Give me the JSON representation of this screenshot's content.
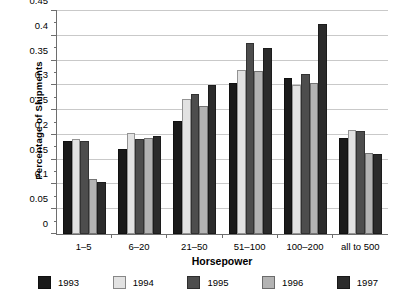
{
  "chart_data": {
    "type": "bar",
    "title": "",
    "xlabel": "Horsepower",
    "ylabel": "Percentage of Shipments",
    "categories": [
      "1–5",
      "6–20",
      "21–50",
      "51–100",
      "100–200",
      "all to 500"
    ],
    "series": [
      {
        "name": "1993",
        "color": "#1a1a1a",
        "values": [
          0.188,
          0.172,
          0.228,
          0.305,
          0.315,
          0.193
        ]
      },
      {
        "name": "1994",
        "color": "#e2e2e2",
        "values": [
          0.191,
          0.204,
          0.272,
          0.33,
          0.3,
          0.21
        ]
      },
      {
        "name": "1995",
        "color": "#4d4d4d",
        "values": [
          0.188,
          0.192,
          0.283,
          0.385,
          0.322,
          0.207
        ]
      },
      {
        "name": "1996",
        "color": "#b3b3b3",
        "values": [
          0.111,
          0.193,
          0.258,
          0.328,
          0.305,
          0.163
        ]
      },
      {
        "name": "1997",
        "color": "#2b2b2b",
        "values": [
          0.105,
          0.198,
          0.3,
          0.375,
          0.423,
          0.162
        ]
      }
    ],
    "ylim": [
      0,
      0.45
    ],
    "ytick_values": [
      0,
      0.05,
      0.1,
      0.15,
      0.2,
      0.25,
      0.3,
      0.35,
      0.4,
      0.45
    ],
    "ytick_labels": [
      "0",
      "0.05",
      "0.1",
      "0.15",
      "0.2",
      "0.25",
      "0.3",
      "0.35",
      "0.4",
      "0.45"
    ],
    "grid": true,
    "legend_position": "bottom",
    "grid_color": "#c9c9c9",
    "axis_color": "#6e6e6e"
  }
}
